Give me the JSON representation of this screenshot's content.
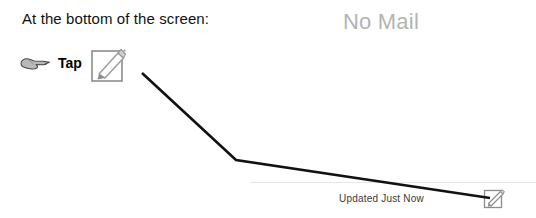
{
  "annotation": {
    "heading": "At the bottom of the screen:",
    "action_label": "Tap",
    "pointer_icon": "pointing-hand-icon",
    "target_icon": "compose-icon",
    "leader_line": {
      "color": "#111111",
      "width": 2.6,
      "points": "142,73 236,160 490,198"
    }
  },
  "app": {
    "empty_state": "No Mail",
    "empty_state_color": "#b3b3b3",
    "toolbar": {
      "status": "Updated Just Now",
      "status_color": "#3a3a3a",
      "compose_button_icon": "compose-icon",
      "divider_color": "#e6e6e6"
    }
  },
  "colors": {
    "background": "#ffffff",
    "icon_outline": "#8c8c8c",
    "hand_fill": "#b9b9b9",
    "hand_outline": "#4a4a4a",
    "text": "#111111"
  }
}
